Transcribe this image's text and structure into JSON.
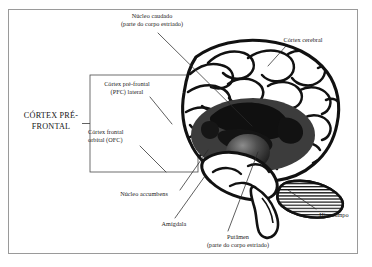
{
  "figure": {
    "language": "pt-BR",
    "frame_color": "#9a9a9a",
    "background_color": "#ffffff",
    "ink_color": "#111111"
  },
  "bracket_label": {
    "line1": "CÓRTEX",
    "line2": "PRÉ-FRONTAL"
  },
  "labels": {
    "caudado": {
      "line1": "Núcleo caudado",
      "line2": "(parte do corpo estriado)"
    },
    "cortex_cerebral": {
      "line1": "Córtex cerebral"
    },
    "pfc_lateral": {
      "line1": "Córtex pré-frontal",
      "line2": "(PFC) lateral"
    },
    "ofc": {
      "line1": "Córtex frontal",
      "line2": "orbital (OFC)"
    },
    "accumbens": {
      "line1": "Núcleo accumbens"
    },
    "amigdala": {
      "line1": "Amígdala"
    },
    "putamen": {
      "line1": "Putâmen",
      "line2": "(parte do corpo estriado)"
    },
    "hipocampo": {
      "line1": "Hipocampo"
    }
  },
  "regions": [
    {
      "name": "cortex-cerebral",
      "fill": "#ffffff",
      "stroke": "#111111"
    },
    {
      "name": "basal-ganglia-mass",
      "fill": "#3c3c3c"
    },
    {
      "name": "caudate-putamen-dark",
      "fill": "#111111"
    },
    {
      "name": "thalamus-sphere",
      "fill": "#4a4a4a"
    },
    {
      "name": "cerebellum",
      "fill": "#ffffff",
      "hatch": "#111111"
    },
    {
      "name": "brainstem",
      "fill": "#ffffff",
      "stroke": "#111111"
    }
  ]
}
